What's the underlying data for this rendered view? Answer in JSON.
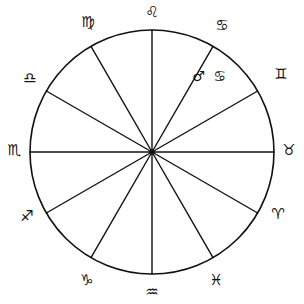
{
  "figure": {
    "background_color": "#ffffff",
    "line_color": "#111111"
  },
  "chart_data": {
    "type": "pie",
    "xlabel": "",
    "ylabel": "",
    "legend_position": "none",
    "grid": false,
    "equal_sectors": true,
    "sector_count": 12,
    "sector_degrees": 30,
    "center": {
      "x": 152,
      "y": 152
    },
    "radius": 122,
    "categories": [
      "Leo",
      "Cancer",
      "Gemini",
      "Taurus",
      "Aries",
      "Pisces",
      "Aquarius",
      "Capricorn",
      "Sagittarius",
      "Scorpio",
      "Libra",
      "Virgo"
    ],
    "values": [
      30,
      30,
      30,
      30,
      30,
      30,
      30,
      30,
      30,
      30,
      30,
      30
    ],
    "annotations": [
      {
        "text": "♂ ♋",
        "meaning": "Mars in Cancer",
        "x": 210,
        "y": 76
      }
    ]
  },
  "wheel": {
    "signs": [
      {
        "name": "Leo",
        "glyph": "♌",
        "x": 152,
        "y": 12,
        "rim_angle_deg": 90
      },
      {
        "name": "Cancer",
        "glyph": "♋",
        "x": 222,
        "y": 25,
        "rim_angle_deg": 60
      },
      {
        "name": "Gemini",
        "glyph": "♊",
        "x": 281,
        "y": 74,
        "rim_angle_deg": 30
      },
      {
        "name": "Taurus",
        "glyph": "♉",
        "x": 289,
        "y": 150,
        "rim_angle_deg": 0
      },
      {
        "name": "Aries",
        "glyph": "♈",
        "x": 278,
        "y": 214,
        "rim_angle_deg": -30
      },
      {
        "name": "Pisces",
        "glyph": "♓",
        "x": 216,
        "y": 280,
        "rim_angle_deg": -60
      },
      {
        "name": "Aquarius",
        "glyph": "♒",
        "x": 152,
        "y": 292,
        "rim_angle_deg": -90
      },
      {
        "name": "Capricorn",
        "glyph": "♑",
        "x": 87,
        "y": 280,
        "rim_angle_deg": -120
      },
      {
        "name": "Sagittarius",
        "glyph": "♐",
        "x": 27,
        "y": 216,
        "rim_angle_deg": -150
      },
      {
        "name": "Scorpio",
        "glyph": "♏",
        "x": 14,
        "y": 150,
        "rim_angle_deg": 180
      },
      {
        "name": "Libra",
        "glyph": "♎",
        "x": 30,
        "y": 78,
        "rim_angle_deg": 150
      },
      {
        "name": "Virgo",
        "glyph": "♍",
        "x": 88,
        "y": 22,
        "rim_angle_deg": 120
      }
    ],
    "inner_annotation": {
      "label": "♂ ♋",
      "planet_glyph": "♂",
      "planet_name": "Mars",
      "sign_glyph": "♋",
      "sign_name": "Cancer",
      "x": 210,
      "y": 76
    }
  }
}
